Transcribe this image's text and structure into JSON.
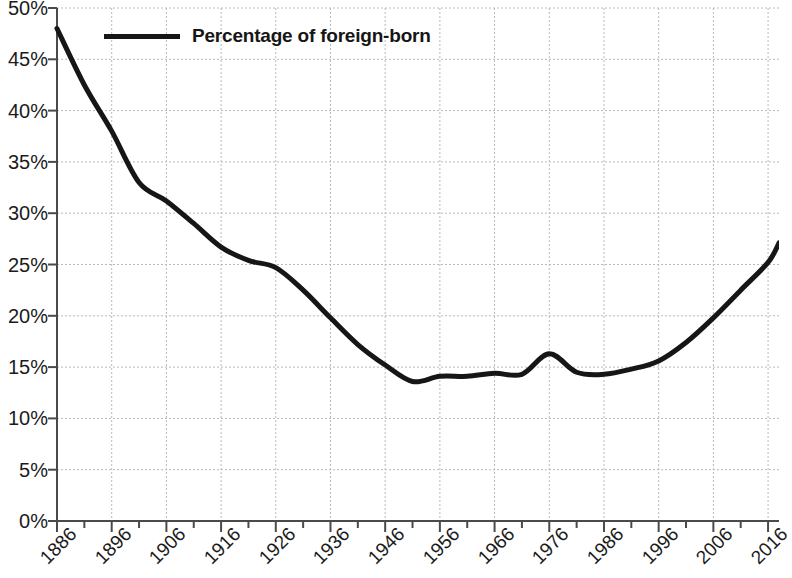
{
  "chart_data": {
    "type": "line",
    "title": "",
    "subtitle": "",
    "xlabel": "",
    "ylabel": "",
    "xlim": [
      1886,
      2018
    ],
    "ylim": [
      0,
      50
    ],
    "grid": true,
    "legend_position": "top-left",
    "legend": [
      "Percentage of foreign-born"
    ],
    "y_ticks": [
      "0%",
      "5%",
      "10%",
      "15%",
      "20%",
      "25%",
      "30%",
      "35%",
      "40%",
      "45%",
      "50%"
    ],
    "y_tick_values": [
      0,
      5,
      10,
      15,
      20,
      25,
      30,
      35,
      40,
      45,
      50
    ],
    "x_ticks": [
      "1886",
      "1896",
      "1906",
      "1916",
      "1926",
      "1936",
      "1946",
      "1956",
      "1966",
      "1976",
      "1986",
      "1996",
      "2006",
      "2016"
    ],
    "x_tick_values": [
      1886,
      1896,
      1906,
      1916,
      1926,
      1936,
      1946,
      1956,
      1966,
      1976,
      1986,
      1996,
      2006,
      2016
    ],
    "x_minor_step": 5,
    "line_color": "#161616",
    "grid_color": "#b9b9b9",
    "axis_color": "#4a4a4a",
    "series": [
      {
        "name": "Percentage of foreign-born",
        "x": [
          1886,
          1891,
          1896,
          1901,
          1906,
          1911,
          1916,
          1921,
          1926,
          1931,
          1936,
          1941,
          1946,
          1951,
          1956,
          1961,
          1966,
          1971,
          1976,
          1981,
          1986,
          1991,
          1996,
          2001,
          2006,
          2011,
          2016,
          2018
        ],
        "values": [
          48.0,
          42.5,
          38.0,
          33.0,
          31.2,
          29.0,
          26.7,
          25.4,
          24.7,
          22.5,
          19.8,
          17.2,
          15.2,
          13.6,
          14.1,
          14.1,
          14.4,
          14.3,
          16.3,
          14.5,
          14.3,
          14.8,
          15.6,
          17.4,
          19.8,
          22.5,
          25.2,
          27.1
        ]
      }
    ]
  },
  "legend": {
    "swatch_name": "line-swatch",
    "label": "Percentage of foreign-born"
  }
}
